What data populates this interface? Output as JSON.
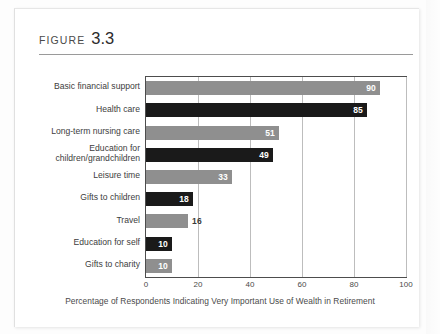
{
  "figure": {
    "label_word": "FIGURE",
    "number": "3.3"
  },
  "chart_data": {
    "type": "bar",
    "orientation": "horizontal",
    "title": "",
    "xlabel": "Percentage of Respondents Indicating Very Important Use of Wealth in Retirement",
    "ylabel": "",
    "xlim": [
      0,
      100
    ],
    "xticks": [
      0,
      20,
      40,
      60,
      80,
      100
    ],
    "xticklabels": [
      "0",
      "20",
      "40",
      "60",
      "80",
      "100"
    ],
    "grid": "vertical",
    "legend": "none",
    "categories": [
      "Basic financial support",
      "Health care",
      "Long-term nursing care",
      "Education for children/grandchildren",
      "Leisure time",
      "Gifts to children",
      "Travel",
      "Education for self",
      "Gifts to charity"
    ],
    "category_lines": [
      [
        "Basic financial support"
      ],
      [
        "Health care"
      ],
      [
        "Long-term nursing care"
      ],
      [
        "Education for",
        "children/grandchildren"
      ],
      [
        "Leisure time"
      ],
      [
        "Gifts to children"
      ],
      [
        "Travel"
      ],
      [
        "Education for self"
      ],
      [
        "Gifts to charity"
      ]
    ],
    "values": [
      90,
      85,
      51,
      49,
      33,
      18,
      16,
      10,
      10
    ],
    "value_labels": [
      "90",
      "85",
      "51",
      "49",
      "33",
      "18",
      "16",
      "10",
      "10"
    ],
    "bar_shades": [
      "light",
      "dark",
      "light",
      "dark",
      "light",
      "dark",
      "light",
      "dark",
      "light"
    ],
    "label_placement": [
      "inside",
      "inside",
      "inside",
      "inside",
      "inside",
      "inside",
      "outside",
      "inside",
      "inside"
    ],
    "colors": {
      "light_bar": "#8f8f8f",
      "dark_bar": "#1a1a1a",
      "gridline": "#bdbdbd",
      "frame": "#4d4d4d",
      "text": "#3d3d3d",
      "page": "#ffffff"
    }
  }
}
